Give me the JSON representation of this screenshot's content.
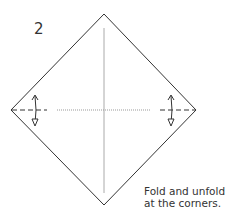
{
  "diagram": {
    "step_number": "2",
    "caption": "Fold and unfold\nat the corners.",
    "colors": {
      "outline": "#333333",
      "center_crease": "#aaaaaa",
      "dotted_crease": "#999999",
      "arrow": "#333333"
    },
    "elements": [
      {
        "type": "square-paper",
        "orientation": "diamond"
      },
      {
        "type": "crease-line",
        "direction": "vertical",
        "style": "solid-light"
      },
      {
        "type": "crease-line",
        "direction": "horizontal",
        "style": "dotted"
      },
      {
        "type": "valley-fold-line",
        "position": "left-corner",
        "style": "dashed"
      },
      {
        "type": "valley-fold-line",
        "position": "right-corner",
        "style": "dashed"
      },
      {
        "type": "fold-unfold-arrow",
        "position": "left-corner"
      },
      {
        "type": "fold-unfold-arrow",
        "position": "right-corner"
      }
    ]
  }
}
